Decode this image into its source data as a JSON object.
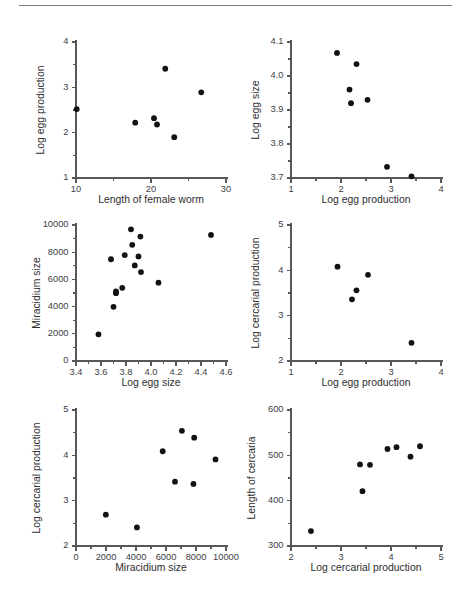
{
  "figure": {
    "rule_label": "horizontal-rule",
    "panel_count": 6
  },
  "chart_data": [
    {
      "id": "panel-1",
      "type": "scatter",
      "title": "",
      "xlabel": "Length of female worm",
      "ylabel": "Log egg production",
      "xlim": [
        10,
        30
      ],
      "ylim": [
        1,
        4
      ],
      "xticks": [
        10,
        20,
        30
      ],
      "xtick_labels": [
        "10",
        "20",
        "30"
      ],
      "yticks": [
        1,
        2,
        3,
        4
      ],
      "ytick_labels": [
        "1",
        "2",
        "3",
        "4"
      ],
      "x_minor_count": 1,
      "y_minor_count": 1,
      "grid": false,
      "legend": null,
      "points": [
        {
          "x": 10.1,
          "y": 2.52
        },
        {
          "x": 17.9,
          "y": 2.22
        },
        {
          "x": 20.4,
          "y": 2.32
        },
        {
          "x": 20.8,
          "y": 2.18
        },
        {
          "x": 21.9,
          "y": 3.41
        },
        {
          "x": 23.1,
          "y": 1.9
        },
        {
          "x": 26.7,
          "y": 2.89
        }
      ]
    },
    {
      "id": "panel-2",
      "type": "scatter",
      "title": "",
      "xlabel": "Log egg production",
      "ylabel": "Log egg size",
      "xlim": [
        1,
        4
      ],
      "ylim": [
        3.7,
        4.1
      ],
      "xticks": [
        1,
        2,
        3,
        4
      ],
      "xtick_labels": [
        "1",
        "2",
        "3",
        "4"
      ],
      "yticks": [
        3.7,
        3.8,
        3.9,
        4.0,
        4.1
      ],
      "ytick_labels": [
        "3.7",
        "3.8",
        "3.9",
        "4.0",
        "4.1"
      ],
      "x_minor_count": 1,
      "y_minor_count": 1,
      "grid": false,
      "legend": null,
      "points": [
        {
          "x": 1.92,
          "y": 4.068
        },
        {
          "x": 2.17,
          "y": 3.96
        },
        {
          "x": 2.2,
          "y": 3.92
        },
        {
          "x": 2.31,
          "y": 4.035
        },
        {
          "x": 2.53,
          "y": 3.93
        },
        {
          "x": 2.92,
          "y": 3.733
        },
        {
          "x": 3.41,
          "y": 3.705
        }
      ]
    },
    {
      "id": "panel-3",
      "type": "scatter",
      "title": "",
      "xlabel": "Log egg size",
      "ylabel": "Miracidium size",
      "xlim": [
        3.4,
        4.6
      ],
      "ylim": [
        0,
        10000
      ],
      "xticks": [
        3.4,
        3.6,
        3.8,
        4.0,
        4.2,
        4.4,
        4.6
      ],
      "xtick_labels": [
        "3.4",
        "3.6",
        "3.8",
        "4.0",
        "4.2",
        "4.4",
        "4.6"
      ],
      "yticks": [
        0,
        2000,
        4000,
        6000,
        8000,
        10000
      ],
      "ytick_labels": [
        "0",
        "2000",
        "4000",
        "6000",
        "8000",
        "10000"
      ],
      "x_minor_count": 1,
      "y_minor_count": 1,
      "grid": false,
      "legend": null,
      "points": [
        {
          "x": 3.58,
          "y": 1960
        },
        {
          "x": 3.68,
          "y": 7480
        },
        {
          "x": 3.7,
          "y": 3980
        },
        {
          "x": 3.72,
          "y": 5120
        },
        {
          "x": 3.72,
          "y": 4990
        },
        {
          "x": 3.77,
          "y": 5380
        },
        {
          "x": 3.79,
          "y": 7790
        },
        {
          "x": 3.84,
          "y": 9680
        },
        {
          "x": 3.85,
          "y": 8540
        },
        {
          "x": 3.87,
          "y": 7030
        },
        {
          "x": 3.9,
          "y": 7690
        },
        {
          "x": 3.915,
          "y": 9150
        },
        {
          "x": 3.92,
          "y": 6540
        },
        {
          "x": 4.06,
          "y": 5760
        },
        {
          "x": 4.48,
          "y": 9270
        }
      ]
    },
    {
      "id": "panel-4",
      "type": "scatter",
      "title": "",
      "xlabel": "Log egg production",
      "ylabel": "Log cercarial production",
      "xlim": [
        1,
        4
      ],
      "ylim": [
        2,
        5
      ],
      "xticks": [
        1,
        2,
        3,
        4
      ],
      "xtick_labels": [
        "1",
        "2",
        "3",
        "4"
      ],
      "yticks": [
        2,
        3,
        4,
        5
      ],
      "ytick_labels": [
        "2",
        "3",
        "4",
        "5"
      ],
      "x_minor_count": 1,
      "y_minor_count": 1,
      "grid": false,
      "legend": null,
      "points": [
        {
          "x": 1.93,
          "y": 4.08
        },
        {
          "x": 2.22,
          "y": 3.36
        },
        {
          "x": 2.31,
          "y": 3.56
        },
        {
          "x": 2.54,
          "y": 3.9
        },
        {
          "x": 3.41,
          "y": 2.4
        }
      ]
    },
    {
      "id": "panel-5",
      "type": "scatter",
      "title": "",
      "xlabel": "Miracidium size",
      "ylabel": "Log cercarial production",
      "xlim": [
        0,
        10000
      ],
      "ylim": [
        2,
        5
      ],
      "xticks": [
        0,
        2000,
        4000,
        6000,
        8000,
        10000
      ],
      "xtick_labels": [
        "0",
        "2000",
        "4000",
        "6000",
        "8000",
        "10000"
      ],
      "yticks": [
        2,
        3,
        4,
        5
      ],
      "ytick_labels": [
        "2",
        "3",
        "4",
        "5"
      ],
      "x_minor_count": 1,
      "y_minor_count": 1,
      "grid": false,
      "legend": null,
      "points": [
        {
          "x": 1990,
          "y": 2.69
        },
        {
          "x": 4060,
          "y": 2.41
        },
        {
          "x": 5780,
          "y": 4.09
        },
        {
          "x": 6600,
          "y": 3.42
        },
        {
          "x": 7060,
          "y": 4.54
        },
        {
          "x": 7830,
          "y": 3.37
        },
        {
          "x": 7880,
          "y": 4.39
        },
        {
          "x": 9300,
          "y": 3.91
        }
      ]
    },
    {
      "id": "panel-6",
      "type": "scatter",
      "title": "",
      "xlabel": "Log cercarial production",
      "ylabel": "Length of cercaria",
      "xlim": [
        2,
        5
      ],
      "ylim": [
        300,
        600
      ],
      "xticks": [
        2,
        3,
        4,
        5
      ],
      "xtick_labels": [
        "2",
        "3",
        "4",
        "5"
      ],
      "yticks": [
        300,
        400,
        500,
        600
      ],
      "ytick_labels": [
        "300",
        "400",
        "500",
        "600"
      ],
      "x_minor_count": 1,
      "y_minor_count": 1,
      "grid": false,
      "legend": null,
      "points": [
        {
          "x": 2.4,
          "y": 333
        },
        {
          "x": 3.38,
          "y": 480
        },
        {
          "x": 3.43,
          "y": 421
        },
        {
          "x": 3.58,
          "y": 479
        },
        {
          "x": 3.93,
          "y": 514
        },
        {
          "x": 4.11,
          "y": 518
        },
        {
          "x": 4.39,
          "y": 497
        },
        {
          "x": 4.58,
          "y": 520
        }
      ]
    }
  ]
}
